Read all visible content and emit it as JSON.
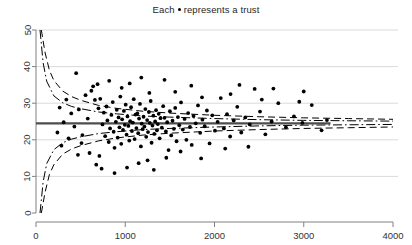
{
  "chart_data": {
    "type": "scatter",
    "title_prefix": "Each",
    "title_suffix": "represents a trust",
    "subtitle": "",
    "xlabel": "",
    "ylabel": "",
    "xlim": [
      0,
      4000
    ],
    "ylim": [
      0,
      50
    ],
    "xticks": [
      0,
      1000,
      2000,
      3000,
      4000
    ],
    "yticks": [
      0,
      10,
      20,
      30,
      40,
      50
    ],
    "xtick_labels": [
      "0",
      "1000",
      "2000",
      "3000",
      "4000"
    ],
    "ytick_labels": [
      "0",
      "10",
      "20",
      "30",
      "40",
      "50"
    ],
    "grid": "horizontal",
    "legend": "none",
    "marker": "filled-circle",
    "marker_color": "#000000",
    "center_line": {
      "label": "overall rate",
      "value": 24.5,
      "style": "solid",
      "color": "#4d4d4d",
      "x_start": 0,
      "x_end": 3300
    },
    "control_limits": [
      {
        "name": "99.8% limits",
        "style": "dashed",
        "color": "#000000",
        "upper_at": [
          [
            60,
            50.0
          ],
          [
            100,
            44.0
          ],
          [
            150,
            39.0
          ],
          [
            200,
            36.2
          ],
          [
            300,
            33.3
          ],
          [
            400,
            31.8
          ],
          [
            500,
            30.8
          ],
          [
            700,
            29.4
          ],
          [
            900,
            28.6
          ],
          [
            1200,
            27.8
          ],
          [
            1500,
            27.3
          ],
          [
            2000,
            26.7
          ],
          [
            2500,
            26.3
          ],
          [
            3000,
            26.0
          ],
          [
            3500,
            25.8
          ],
          [
            4000,
            25.6
          ]
        ],
        "lower_at": [
          [
            60,
            0.0
          ],
          [
            100,
            5.5
          ],
          [
            150,
            10.5
          ],
          [
            200,
            13.2
          ],
          [
            300,
            16.1
          ],
          [
            400,
            17.5
          ],
          [
            500,
            18.4
          ],
          [
            700,
            19.7
          ],
          [
            900,
            20.5
          ],
          [
            1200,
            21.3
          ],
          [
            1500,
            21.8
          ],
          [
            2000,
            22.4
          ],
          [
            2500,
            22.8
          ],
          [
            3000,
            23.1
          ],
          [
            3500,
            23.3
          ],
          [
            4000,
            23.5
          ]
        ]
      },
      {
        "name": "95% limits",
        "style": "dash-dot",
        "color": "#000000",
        "upper_at": [
          [
            45,
            50.0
          ],
          [
            80,
            41.0
          ],
          [
            120,
            36.0
          ],
          [
            200,
            32.0
          ],
          [
            300,
            30.1
          ],
          [
            400,
            29.1
          ],
          [
            500,
            28.5
          ],
          [
            700,
            27.6
          ],
          [
            900,
            27.1
          ],
          [
            1200,
            26.5
          ],
          [
            1500,
            26.2
          ],
          [
            2000,
            25.8
          ],
          [
            2500,
            25.5
          ],
          [
            3000,
            25.3
          ],
          [
            3500,
            25.2
          ],
          [
            4000,
            25.1
          ]
        ],
        "lower_at": [
          [
            45,
            0.0
          ],
          [
            80,
            8.5
          ],
          [
            120,
            13.5
          ],
          [
            200,
            17.3
          ],
          [
            300,
            19.2
          ],
          [
            400,
            20.2
          ],
          [
            500,
            20.8
          ],
          [
            700,
            21.7
          ],
          [
            900,
            22.2
          ],
          [
            1200,
            22.8
          ],
          [
            1500,
            23.1
          ],
          [
            2000,
            23.5
          ],
          [
            2500,
            23.8
          ],
          [
            3000,
            24.0
          ],
          [
            3500,
            24.1
          ],
          [
            4000,
            24.2
          ]
        ]
      }
    ],
    "points": [
      [
        620,
        33.4
      ],
      [
        660,
        30.9
      ],
      [
        690,
        35.2
      ],
      [
        700,
        28.6
      ],
      [
        720,
        31.2
      ],
      [
        745,
        24.2
      ],
      [
        760,
        27.4
      ],
      [
        775,
        21.0
      ],
      [
        790,
        29.1
      ],
      [
        800,
        25.3
      ],
      [
        815,
        19.4
      ],
      [
        830,
        23.1
      ],
      [
        845,
        26.8
      ],
      [
        860,
        30.3
      ],
      [
        870,
        22.2
      ],
      [
        880,
        17.8
      ],
      [
        895,
        24.9
      ],
      [
        905,
        28.2
      ],
      [
        915,
        20.6
      ],
      [
        925,
        26.1
      ],
      [
        935,
        23.4
      ],
      [
        945,
        31.8
      ],
      [
        955,
        18.9
      ],
      [
        965,
        25.6
      ],
      [
        975,
        22.7
      ],
      [
        985,
        27.9
      ],
      [
        995,
        24.1
      ],
      [
        1005,
        29.6
      ],
      [
        1015,
        21.4
      ],
      [
        1025,
        26.4
      ],
      [
        1035,
        23.8
      ],
      [
        1045,
        19.8
      ],
      [
        1055,
        25.1
      ],
      [
        1065,
        28.9
      ],
      [
        1075,
        22.4
      ],
      [
        1085,
        24.7
      ],
      [
        1095,
        31.1
      ],
      [
        1105,
        20.2
      ],
      [
        1115,
        26.9
      ],
      [
        1125,
        23.2
      ],
      [
        1135,
        27.2
      ],
      [
        1145,
        21.8
      ],
      [
        1155,
        25.8
      ],
      [
        1165,
        29.8
      ],
      [
        1175,
        18.2
      ],
      [
        1185,
        24.4
      ],
      [
        1195,
        22.9
      ],
      [
        1205,
        26.3
      ],
      [
        1215,
        23.6
      ],
      [
        1225,
        28.4
      ],
      [
        1235,
        20.8
      ],
      [
        1245,
        25.4
      ],
      [
        1255,
        22.1
      ],
      [
        1265,
        27.6
      ],
      [
        1275,
        24.6
      ],
      [
        1285,
        30.6
      ],
      [
        1295,
        19.2
      ],
      [
        1305,
        23.9
      ],
      [
        1315,
        26.6
      ],
      [
        1325,
        21.6
      ],
      [
        1335,
        25.0
      ],
      [
        1345,
        28.1
      ],
      [
        1355,
        22.6
      ],
      [
        1365,
        24.3
      ],
      [
        1375,
        27.1
      ],
      [
        1385,
        20.4
      ],
      [
        1395,
        25.9
      ],
      [
        1410,
        23.3
      ],
      [
        1425,
        29.2
      ],
      [
        1440,
        26.0
      ],
      [
        1455,
        22.3
      ],
      [
        1470,
        24.8
      ],
      [
        1485,
        17.2
      ],
      [
        1500,
        27.8
      ],
      [
        1515,
        21.2
      ],
      [
        1530,
        25.2
      ],
      [
        1545,
        23.0
      ],
      [
        1560,
        28.7
      ],
      [
        1575,
        19.6
      ],
      [
        1590,
        26.2
      ],
      [
        1605,
        24.0
      ],
      [
        1625,
        30.2
      ],
      [
        1645,
        22.8
      ],
      [
        1665,
        25.7
      ],
      [
        1685,
        20.0
      ],
      [
        1705,
        27.3
      ],
      [
        1725,
        23.5
      ],
      [
        1745,
        18.6
      ],
      [
        1765,
        26.5
      ],
      [
        1790,
        24.5
      ],
      [
        1815,
        29.4
      ],
      [
        1840,
        21.9
      ],
      [
        1865,
        25.5
      ],
      [
        1890,
        23.7
      ],
      [
        1915,
        28.0
      ],
      [
        1945,
        19.0
      ],
      [
        1975,
        26.7
      ],
      [
        2005,
        22.5
      ],
      [
        2035,
        24.9
      ],
      [
        2070,
        31.4
      ],
      [
        2105,
        23.1
      ],
      [
        2140,
        27.0
      ],
      [
        2175,
        20.9
      ],
      [
        2215,
        25.3
      ],
      [
        2255,
        29.0
      ],
      [
        2300,
        22.0
      ],
      [
        2345,
        26.1
      ],
      [
        2395,
        24.2
      ],
      [
        2450,
        33.9
      ],
      [
        2510,
        27.7
      ],
      [
        2570,
        21.5
      ],
      [
        2640,
        25.0
      ],
      [
        2715,
        30.0
      ],
      [
        2800,
        23.4
      ],
      [
        2890,
        26.4
      ],
      [
        2985,
        24.6
      ],
      [
        3090,
        29.5
      ],
      [
        3200,
        22.6
      ],
      [
        3260,
        25.4
      ],
      [
        450,
        38.2
      ],
      [
        480,
        28.3
      ],
      [
        520,
        21.3
      ],
      [
        555,
        32.2
      ],
      [
        580,
        25.8
      ],
      [
        600,
        16.4
      ],
      [
        640,
        34.6
      ],
      [
        675,
        13.2
      ],
      [
        710,
        15.6
      ],
      [
        735,
        12.1
      ],
      [
        1150,
        13.6
      ],
      [
        1250,
        14.4
      ],
      [
        1460,
        15.1
      ],
      [
        1620,
        16.8
      ],
      [
        1850,
        14.9
      ],
      [
        2120,
        17.6
      ],
      [
        2380,
        18.1
      ],
      [
        1020,
        12.4
      ],
      [
        1320,
        11.8
      ],
      [
        880,
        10.9
      ],
      [
        960,
        34.2
      ],
      [
        1270,
        32.8
      ],
      [
        1560,
        33.1
      ],
      [
        1860,
        31.6
      ],
      [
        2180,
        32.5
      ],
      [
        2530,
        31.0
      ],
      [
        2950,
        30.4
      ],
      [
        1740,
        34.8
      ],
      [
        1050,
        35.4
      ],
      [
        820,
        36.1
      ],
      [
        510,
        19.1
      ],
      [
        470,
        15.9
      ],
      [
        430,
        23.6
      ],
      [
        395,
        27.2
      ],
      [
        365,
        20.4
      ],
      [
        340,
        31.0
      ],
      [
        310,
        24.8
      ],
      [
        285,
        18.4
      ],
      [
        265,
        28.8
      ],
      [
        240,
        22.0
      ],
      [
        2280,
        35.0
      ],
      [
        2660,
        34.0
      ],
      [
        3000,
        33.2
      ],
      [
        1440,
        36.4
      ],
      [
        1180,
        37.0
      ]
    ],
    "n_points": 165
  }
}
